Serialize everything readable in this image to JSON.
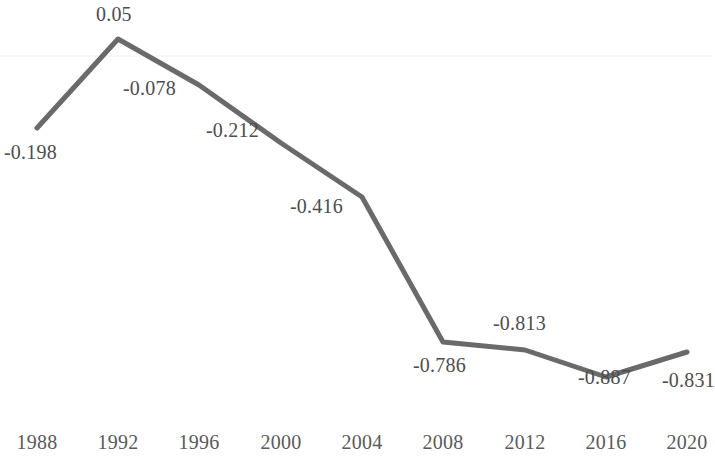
{
  "chart_data": {
    "type": "line",
    "title": "",
    "subtitle": "",
    "xlabel": "",
    "ylabel": "",
    "categories": [
      "1988",
      "1992",
      "1996",
      "2000",
      "2004",
      "2008",
      "2012",
      "2016",
      "2020"
    ],
    "values": [
      -0.198,
      0.05,
      -0.078,
      -0.212,
      -0.416,
      -0.786,
      -0.813,
      -0.887,
      -0.831
    ],
    "point_labels": [
      "-0.198",
      "0.05",
      "-0.078",
      "-0.212",
      "-0.416",
      "-0.786",
      "-0.813",
      "-0.887",
      "-0.831"
    ],
    "series": [
      {
        "name": "",
        "values": [
          -0.198,
          0.05,
          -0.078,
          -0.212,
          -0.416,
          -0.786,
          -0.813,
          -0.887,
          -0.831
        ]
      }
    ],
    "xlim": [
      1988,
      2020
    ],
    "ylim": [
      -0.95,
      0.08
    ],
    "grid": true,
    "gridlines": [
      0
    ],
    "legend": "none",
    "y_axis_visible": false,
    "x_axis_visible": false,
    "markers": false,
    "line_color": "#6a6a6a",
    "line_width": 5,
    "label_color": "#4d4d4d",
    "tick_color": "#5a5a5a",
    "gridline_color": "#f2f2f2",
    "background_color": "#ffffff"
  },
  "axis": {
    "ticks": [
      {
        "label": "1988",
        "x": 37
      },
      {
        "label": "1992",
        "x": 118
      },
      {
        "label": "1996",
        "x": 199
      },
      {
        "label": "2000",
        "x": 281
      },
      {
        "label": "2004",
        "x": 362
      },
      {
        "label": "2008",
        "x": 443
      },
      {
        "label": "2012",
        "x": 525
      },
      {
        "label": "2016",
        "x": 606
      },
      {
        "label": "2020",
        "x": 687
      }
    ]
  },
  "labels": {
    "points": [
      {
        "text": "-0.198",
        "left": 4,
        "top": 142
      },
      {
        "text": "0.05",
        "left": 96,
        "top": 4
      },
      {
        "text": "-0.078",
        "left": 123,
        "top": 78
      },
      {
        "text": "-0.212",
        "left": 206,
        "top": 120
      },
      {
        "text": "-0.416",
        "left": 290,
        "top": 196
      },
      {
        "text": "-0.786",
        "left": 413,
        "top": 355
      },
      {
        "text": "-0.813",
        "left": 493,
        "top": 313
      },
      {
        "text": "-0.887",
        "left": 578,
        "top": 367
      },
      {
        "text": "-0.831",
        "left": 662,
        "top": 370
      }
    ]
  },
  "geometry": {
    "points": [
      {
        "x": 37,
        "y": 128
      },
      {
        "x": 118,
        "y": 39
      },
      {
        "x": 199,
        "y": 85
      },
      {
        "x": 281,
        "y": 143
      },
      {
        "x": 362,
        "y": 197
      },
      {
        "x": 443,
        "y": 342
      },
      {
        "x": 525,
        "y": 350
      },
      {
        "x": 606,
        "y": 377
      },
      {
        "x": 687,
        "y": 352
      }
    ],
    "zero_gridline_y": 56
  }
}
